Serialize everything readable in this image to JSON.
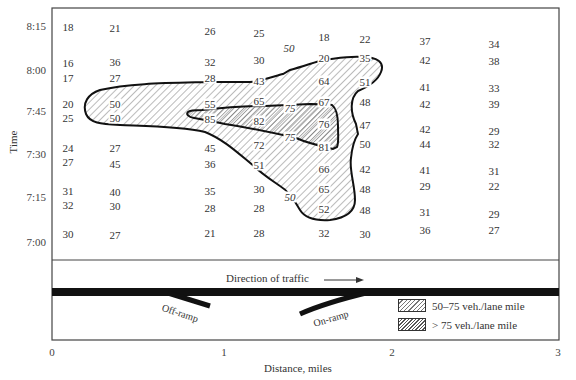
{
  "figure": {
    "y_axis_title": "Time",
    "x_axis_title": "Distance, miles",
    "y_ticks": [
      {
        "label": "8:15",
        "y": 26
      },
      {
        "label": "8:00",
        "y": 70
      },
      {
        "label": "7:45",
        "y": 111
      },
      {
        "label": "7:30",
        "y": 154
      },
      {
        "label": "7:15",
        "y": 197
      },
      {
        "label": "7:00",
        "y": 242
      }
    ],
    "x_ticks": [
      {
        "label": "0",
        "x": 52
      },
      {
        "label": "1",
        "x": 224
      },
      {
        "label": "2",
        "x": 392
      },
      {
        "label": "3",
        "x": 558
      }
    ],
    "direction_label": "Direction of traffic",
    "off_ramp_label": "Off-ramp",
    "on_ramp_label": "On-ramp",
    "legend": [
      {
        "label": "50–75 veh./lane mile"
      },
      {
        "label": "> 75 veh./lane mile"
      }
    ],
    "contour_labels": [
      {
        "text": "50",
        "x": 289,
        "y": 48
      },
      {
        "text": "75",
        "x": 290,
        "y": 108
      },
      {
        "text": "75",
        "x": 290,
        "y": 137
      },
      {
        "text": "50",
        "x": 290,
        "y": 197
      }
    ]
  },
  "chart_data": {
    "type": "heatmap",
    "xlabel": "Distance, miles",
    "ylabel": "Time",
    "xlim": [
      0,
      3
    ],
    "x_ticks": [
      "0",
      "1",
      "2",
      "3"
    ],
    "y_ticks": [
      "7:00",
      "7:15",
      "7:30",
      "7:45",
      "8:00",
      "8:15"
    ],
    "columns_x_px": [
      68,
      115,
      210,
      259,
      325,
      365,
      426,
      494
    ],
    "rows": [
      {
        "y": 27,
        "values": [
          18,
          21,
          26,
          25,
          18,
          22,
          37,
          34
        ]
      },
      {
        "y": 62,
        "values": [
          16,
          36,
          32,
          30,
          20,
          35,
          42,
          38
        ]
      },
      {
        "y": 78,
        "values": [
          17,
          27,
          28,
          43,
          64,
          51,
          41,
          33
        ]
      },
      {
        "y": 104,
        "values": [
          20,
          50,
          55,
          65,
          67,
          48,
          42,
          39
        ]
      },
      {
        "y": 118,
        "values": [
          25,
          50,
          85,
          82,
          76,
          47,
          42,
          29
        ]
      },
      {
        "y": 148,
        "values": [
          24,
          27,
          45,
          72,
          81,
          50,
          44,
          32
        ]
      },
      {
        "y": 163,
        "values": [
          27,
          45,
          36,
          51,
          66,
          42,
          41,
          31
        ]
      },
      {
        "y": 190,
        "values": [
          31,
          40,
          35,
          30,
          65,
          48,
          29,
          22
        ]
      },
      {
        "y": 205,
        "values": [
          32,
          30,
          28,
          28,
          52,
          48,
          31,
          29
        ]
      },
      {
        "y": 233,
        "values": [
          30,
          27,
          21,
          28,
          32,
          30,
          36,
          27
        ]
      }
    ],
    "cells": [
      {
        "t": "18",
        "x": 68,
        "y": 27
      },
      {
        "t": "21",
        "x": 115,
        "y": 28
      },
      {
        "t": "26",
        "x": 210,
        "y": 31
      },
      {
        "t": "25",
        "x": 259,
        "y": 33
      },
      {
        "t": "18",
        "x": 324,
        "y": 37
      },
      {
        "t": "22",
        "x": 365,
        "y": 39
      },
      {
        "t": "37",
        "x": 425,
        "y": 41
      },
      {
        "t": "34",
        "x": 494,
        "y": 44
      },
      {
        "t": "16",
        "x": 68,
        "y": 63
      },
      {
        "t": "36",
        "x": 115,
        "y": 62
      },
      {
        "t": "32",
        "x": 210,
        "y": 62
      },
      {
        "t": "30",
        "x": 259,
        "y": 60
      },
      {
        "t": "20",
        "x": 324,
        "y": 58
      },
      {
        "t": "35",
        "x": 365,
        "y": 58
      },
      {
        "t": "42",
        "x": 425,
        "y": 60
      },
      {
        "t": "38",
        "x": 494,
        "y": 61
      },
      {
        "t": "17",
        "x": 68,
        "y": 78
      },
      {
        "t": "27",
        "x": 115,
        "y": 78
      },
      {
        "t": "28",
        "x": 210,
        "y": 78
      },
      {
        "t": "43",
        "x": 259,
        "y": 81
      },
      {
        "t": "64",
        "x": 324,
        "y": 81
      },
      {
        "t": "51",
        "x": 365,
        "y": 82
      },
      {
        "t": "41",
        "x": 425,
        "y": 87
      },
      {
        "t": "33",
        "x": 494,
        "y": 88
      },
      {
        "t": "20",
        "x": 68,
        "y": 104
      },
      {
        "t": "50",
        "x": 115,
        "y": 104
      },
      {
        "t": "55",
        "x": 210,
        "y": 104
      },
      {
        "t": "65",
        "x": 259,
        "y": 101
      },
      {
        "t": "67",
        "x": 324,
        "y": 102
      },
      {
        "t": "48",
        "x": 365,
        "y": 102
      },
      {
        "t": "42",
        "x": 425,
        "y": 104
      },
      {
        "t": "39",
        "x": 494,
        "y": 104
      },
      {
        "t": "25",
        "x": 68,
        "y": 118
      },
      {
        "t": "50",
        "x": 115,
        "y": 118
      },
      {
        "t": "85",
        "x": 210,
        "y": 119
      },
      {
        "t": "82",
        "x": 259,
        "y": 121
      },
      {
        "t": "76",
        "x": 324,
        "y": 124
      },
      {
        "t": "47",
        "x": 365,
        "y": 125
      },
      {
        "t": "42",
        "x": 425,
        "y": 129
      },
      {
        "t": "29",
        "x": 494,
        "y": 131
      },
      {
        "t": "24",
        "x": 68,
        "y": 148
      },
      {
        "t": "27",
        "x": 115,
        "y": 148
      },
      {
        "t": "45",
        "x": 210,
        "y": 148
      },
      {
        "t": "72",
        "x": 259,
        "y": 145
      },
      {
        "t": "81",
        "x": 324,
        "y": 147
      },
      {
        "t": "50",
        "x": 365,
        "y": 144
      },
      {
        "t": "44",
        "x": 425,
        "y": 144
      },
      {
        "t": "32",
        "x": 494,
        "y": 144
      },
      {
        "t": "27",
        "x": 68,
        "y": 162
      },
      {
        "t": "45",
        "x": 115,
        "y": 164
      },
      {
        "t": "36",
        "x": 210,
        "y": 164
      },
      {
        "t": "51",
        "x": 259,
        "y": 165
      },
      {
        "t": "66",
        "x": 324,
        "y": 169
      },
      {
        "t": "42",
        "x": 365,
        "y": 169
      },
      {
        "t": "41",
        "x": 425,
        "y": 170
      },
      {
        "t": "31",
        "x": 494,
        "y": 171
      },
      {
        "t": "31",
        "x": 68,
        "y": 191
      },
      {
        "t": "40",
        "x": 115,
        "y": 192
      },
      {
        "t": "35",
        "x": 210,
        "y": 191
      },
      {
        "t": "30",
        "x": 259,
        "y": 189
      },
      {
        "t": "65",
        "x": 324,
        "y": 189
      },
      {
        "t": "48",
        "x": 365,
        "y": 189
      },
      {
        "t": "29",
        "x": 425,
        "y": 186
      },
      {
        "t": "22",
        "x": 494,
        "y": 186
      },
      {
        "t": "32",
        "x": 68,
        "y": 205
      },
      {
        "t": "30",
        "x": 115,
        "y": 206
      },
      {
        "t": "28",
        "x": 210,
        "y": 208
      },
      {
        "t": "28",
        "x": 259,
        "y": 208
      },
      {
        "t": "52",
        "x": 324,
        "y": 209
      },
      {
        "t": "48",
        "x": 365,
        "y": 210
      },
      {
        "t": "31",
        "x": 425,
        "y": 212
      },
      {
        "t": "29",
        "x": 494,
        "y": 214
      },
      {
        "t": "30",
        "x": 68,
        "y": 234
      },
      {
        "t": "27",
        "x": 115,
        "y": 235
      },
      {
        "t": "21",
        "x": 210,
        "y": 233
      },
      {
        "t": "28",
        "x": 259,
        "y": 233
      },
      {
        "t": "32",
        "x": 324,
        "y": 233
      },
      {
        "t": "30",
        "x": 365,
        "y": 234
      },
      {
        "t": "36",
        "x": 425,
        "y": 230
      },
      {
        "t": "27",
        "x": 494,
        "y": 230
      }
    ],
    "contours": [
      {
        "level": 50,
        "description": "outer boundary enclosing congested region, 50–75 veh./lane mile"
      },
      {
        "level": 75,
        "description": "inner boundary, > 75 veh./lane mile"
      }
    ],
    "legend": [
      "50–75 veh./lane mile",
      "> 75 veh./lane mile"
    ],
    "legend_position": "lower right",
    "grid": false
  }
}
